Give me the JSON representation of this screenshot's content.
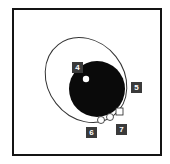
{
  "diagram": {
    "labels": [
      {
        "id": "4",
        "text": "4"
      },
      {
        "id": "5",
        "text": "5"
      },
      {
        "id": "6",
        "text": "6"
      },
      {
        "id": "7",
        "text": "7"
      }
    ],
    "colors": {
      "frame": "#141414",
      "disc": "#0a0a0a",
      "ellipse_stroke": "#333333",
      "label_bg": "#3a3a3a",
      "label_text": "#ffffff"
    }
  }
}
